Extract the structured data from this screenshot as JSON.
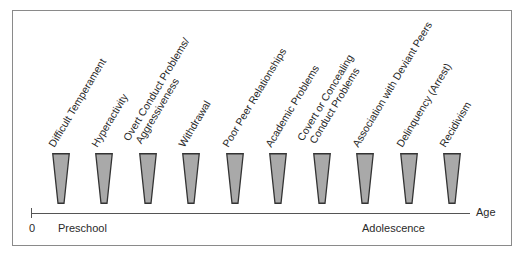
{
  "diagram": {
    "stages": [
      {
        "label_lines": [
          "Difficult Temperament"
        ],
        "x": 52
      },
      {
        "label_lines": [
          "Hyperactivity"
        ],
        "x": 95
      },
      {
        "label_lines": [
          "Overt Conduct Problems/",
          "Aggressiveness"
        ],
        "x": 139
      },
      {
        "label_lines": [
          "Withdrawal"
        ],
        "x": 182
      },
      {
        "label_lines": [
          "Poor Peer Relationships"
        ],
        "x": 226
      },
      {
        "label_lines": [
          "Academic Problems"
        ],
        "x": 269
      },
      {
        "label_lines": [
          "Covert or Concealing",
          "Conduct Problems"
        ],
        "x": 313
      },
      {
        "label_lines": [
          "Association with Deviant Peers"
        ],
        "x": 356
      },
      {
        "label_lines": [
          "Delinquency (Arrest)"
        ],
        "x": 400
      },
      {
        "label_lines": [
          "Recidivism"
        ],
        "x": 443
      }
    ],
    "axis": {
      "title": "Age",
      "origin_label": "0",
      "start_label": "Preschool",
      "end_label": "Adolescence"
    },
    "colors": {
      "marker_fill": "#a9a9a9",
      "marker_stroke": "#333333",
      "frame": "#8a8a8a"
    }
  }
}
